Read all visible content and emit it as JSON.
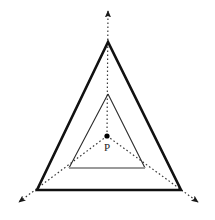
{
  "figure": {
    "kind": "geometry-diagram",
    "canvas": {
      "width": 215,
      "height": 220,
      "background": "#ffffff"
    },
    "colors": {
      "outer_stroke": "#111111",
      "inner_stroke": "#2b2b2b",
      "inner_base_stroke": "#9a9a9a",
      "ray_stroke": "#3a3a3a",
      "point_fill": "#000000",
      "label_color": "#1c1c1c"
    },
    "labels": [
      {
        "id": "label-p",
        "text": "P",
        "x": 104,
        "y": 142
      }
    ],
    "points": [
      {
        "id": "center-p",
        "name": "P",
        "x": 107,
        "y": 136,
        "radius": 2.6
      }
    ],
    "shapes": [
      {
        "id": "outer-triangle",
        "name": "outer-triangle",
        "type": "polygon",
        "stroke_width": 2.6,
        "stroke_color": "#111111",
        "fill": "none",
        "vertices": [
          {
            "name": "apex",
            "x": 108,
            "y": 42
          },
          {
            "name": "bottom-left",
            "x": 37,
            "y": 190
          },
          {
            "name": "bottom-right",
            "x": 181,
            "y": 190
          }
        ]
      },
      {
        "id": "inner-triangle",
        "name": "inner-triangle",
        "type": "polygon",
        "stroke_width": 1.1,
        "stroke_color": "#2b2b2b",
        "fill": "none",
        "base_stroke_color": "#9a9a9a",
        "base_stroke_width": 2.0,
        "vertices": [
          {
            "name": "apex",
            "x": 108,
            "y": 94
          },
          {
            "name": "bottom-left",
            "x": 69,
            "y": 168
          },
          {
            "name": "bottom-right",
            "x": 145,
            "y": 168
          }
        ]
      }
    ],
    "rays": [
      {
        "id": "ray-up",
        "name": "ray-to-apex",
        "from": {
          "x": 107,
          "y": 136
        },
        "to": {
          "x": 108,
          "y": 11
        },
        "dash": "1.6 2.4",
        "stroke_width": 1.2,
        "arrowhead": true
      },
      {
        "id": "ray-down-left",
        "name": "ray-to-bottom-left",
        "from": {
          "x": 107,
          "y": 136
        },
        "to": {
          "x": 19,
          "y": 202
        },
        "dash": "1.6 2.4",
        "stroke_width": 1.2,
        "arrowhead": true
      },
      {
        "id": "ray-down-right",
        "name": "ray-to-bottom-right",
        "from": {
          "x": 107,
          "y": 136
        },
        "to": {
          "x": 198,
          "y": 202
        },
        "dash": "1.6 2.4",
        "stroke_width": 1.2,
        "arrowhead": true
      }
    ]
  }
}
